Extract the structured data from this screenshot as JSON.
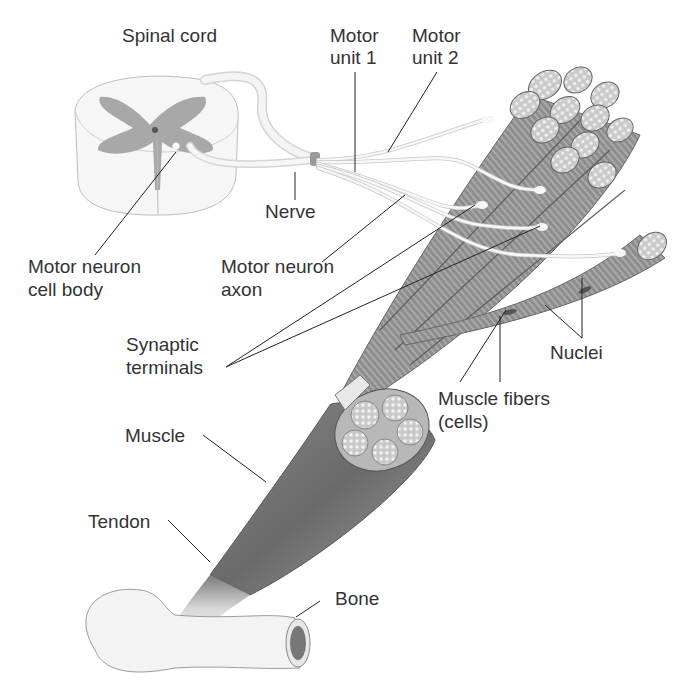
{
  "diagram": {
    "labels": {
      "spinal_cord": "Spinal cord",
      "motor_unit_1_line1": "Motor",
      "motor_unit_1_line2": "unit 1",
      "motor_unit_2_line1": "Motor",
      "motor_unit_2_line2": "unit 2",
      "nerve": "Nerve",
      "motor_neuron_cell_body_line1": "Motor neuron",
      "motor_neuron_cell_body_line2": "cell body",
      "motor_neuron_axon_line1": "Motor neuron",
      "motor_neuron_axon_line2": "axon",
      "synaptic_terminals_line1": "Synaptic",
      "synaptic_terminals_line2": "terminals",
      "nuclei": "Nuclei",
      "muscle_fibers_line1": "Muscle fibers",
      "muscle_fibers_line2": "(cells)",
      "muscle": "Muscle",
      "tendon": "Tendon",
      "bone": "Bone"
    },
    "colors": {
      "label_text": "#333333",
      "leader_line": "#222222",
      "gray_matter": "#a8a8a8",
      "white_matter": "#f2f2f2",
      "muscle_dark": "#6e6e6e",
      "muscle_mid": "#9a9a9a",
      "nerve_fiber": "#f5f5f5"
    }
  }
}
